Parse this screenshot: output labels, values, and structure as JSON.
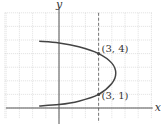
{
  "chart_data": {
    "type": "line",
    "title": "",
    "xlabel": "x",
    "ylabel": "y",
    "xlim": [
      -4.1,
      7.1
    ],
    "ylim": [
      -0.8,
      7.0
    ],
    "grid": true,
    "grid_x": [
      -4,
      -3,
      -2,
      -1,
      0,
      1,
      2,
      3,
      4,
      5,
      6,
      7
    ],
    "grid_y": [
      0,
      1,
      2,
      3,
      4,
      5,
      6,
      7
    ],
    "vertical_dashed_line": {
      "x": 3
    },
    "series": [
      {
        "name": "parabola",
        "color": "#444444",
        "points": [
          [
            -1.5,
            4.9
          ],
          [
            0,
            4.78
          ],
          [
            1.5,
            4.5
          ],
          [
            3,
            4
          ],
          [
            4,
            3.3
          ],
          [
            4.3,
            2.55
          ],
          [
            4,
            1.8
          ],
          [
            3,
            1
          ],
          [
            1.5,
            0.5
          ],
          [
            0,
            0.25
          ],
          [
            -1.5,
            0.15
          ]
        ]
      }
    ],
    "annotations": [
      {
        "text": "(3, 4)",
        "x": 3,
        "y": 4
      },
      {
        "text": "(3, 1)",
        "x": 3,
        "y": 1
      }
    ]
  }
}
